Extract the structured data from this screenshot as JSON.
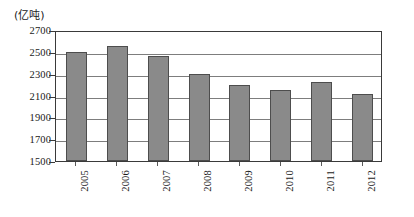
{
  "chart_data": {
    "type": "bar",
    "title": "",
    "subtitle": "",
    "unit_label": "(亿吨)",
    "xlabel": "",
    "ylabel": "",
    "categories": [
      "2005",
      "2006",
      "2007",
      "2008",
      "2009",
      "2010",
      "2011",
      "2012"
    ],
    "values": [
      2500,
      2550,
      2460,
      2300,
      2195,
      2155,
      2220,
      2115
    ],
    "series": [
      {
        "name": "",
        "values": [
          2500,
          2550,
          2460,
          2300,
          2195,
          2155,
          2220,
          2115
        ]
      }
    ],
    "ylim": [
      1500,
      2700
    ],
    "ytick_step": 200,
    "ytick_labels": [
      "2700",
      "2500",
      "2300",
      "2100",
      "1900",
      "1700",
      "1500"
    ],
    "ytick_values": [
      2700,
      2500,
      2300,
      2100,
      1900,
      1700,
      1500
    ],
    "grid": "horizontal",
    "legend": "none",
    "legend_position": "",
    "bar_color": "#8a8a8a",
    "bar_edge_color": "#4d4d4d",
    "grid_color": "#7d7d7d",
    "axis_color": "#3a3a3a",
    "background_color": "#ffffff",
    "xtick_rotation": -90,
    "annotations": []
  }
}
